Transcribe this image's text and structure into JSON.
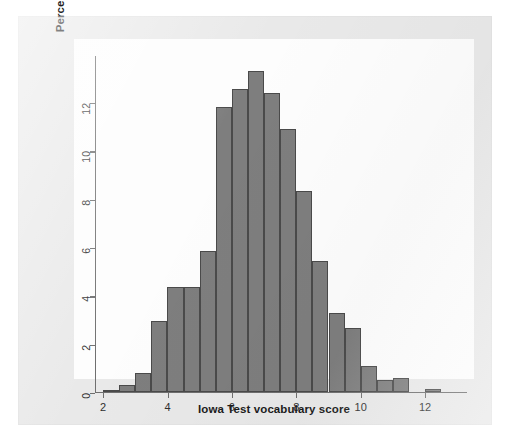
{
  "chart_data": {
    "type": "bar",
    "title": "",
    "subtitle": "",
    "xlabel": "Iowa Test vocabulary score",
    "ylabel": "Percent of seventh-grade students",
    "xlim": [
      1.75,
      13.3
    ],
    "ylim": [
      0,
      13.95
    ],
    "grid": false,
    "legend": null,
    "bin_width": 0.5,
    "bar_fill_color": "#7e7e7e",
    "bar_border_color": "#4a4a4a",
    "plot_background_color": "#fdfdfd",
    "page_background_color": "#e9e9e9",
    "xticks": [
      2,
      4,
      6,
      8,
      10,
      12
    ],
    "xtick_labels": [
      "2",
      "4",
      "6",
      "8",
      "10",
      "12"
    ],
    "yticks": [
      0,
      2,
      4,
      6,
      8,
      10,
      12
    ],
    "ytick_labels": [
      "0",
      "2",
      "4",
      "6",
      "8",
      "10",
      "12"
    ],
    "categories": [
      "2.0-2.5",
      "2.5-3.0",
      "3.0-3.5",
      "3.5-4.0",
      "4.0-4.5",
      "4.5-5.0",
      "5.0-5.5",
      "5.5-6.0",
      "6.0-6.5",
      "6.5-7.0",
      "7.0-7.5",
      "7.5-8.0",
      "8.0-8.5",
      "8.5-9.0",
      "9.0-9.5",
      "9.5-10.0",
      "10.0-10.5",
      "10.5-11.0",
      "11.0-11.5",
      "11.5-12.0",
      "12.0-12.5"
    ],
    "bin_starts": [
      2.0,
      2.5,
      3.0,
      3.5,
      4.0,
      4.5,
      5.0,
      5.5,
      6.0,
      6.5,
      7.0,
      7.5,
      8.0,
      8.5,
      9.0,
      9.5,
      10.0,
      10.5,
      11.0,
      11.5,
      12.0
    ],
    "values": [
      0.1,
      0.3,
      0.8,
      2.95,
      4.35,
      4.35,
      5.85,
      11.8,
      12.55,
      13.3,
      12.4,
      10.9,
      8.35,
      5.45,
      3.3,
      2.65,
      1.1,
      0.5,
      0.6,
      0.0,
      0.15
    ]
  }
}
